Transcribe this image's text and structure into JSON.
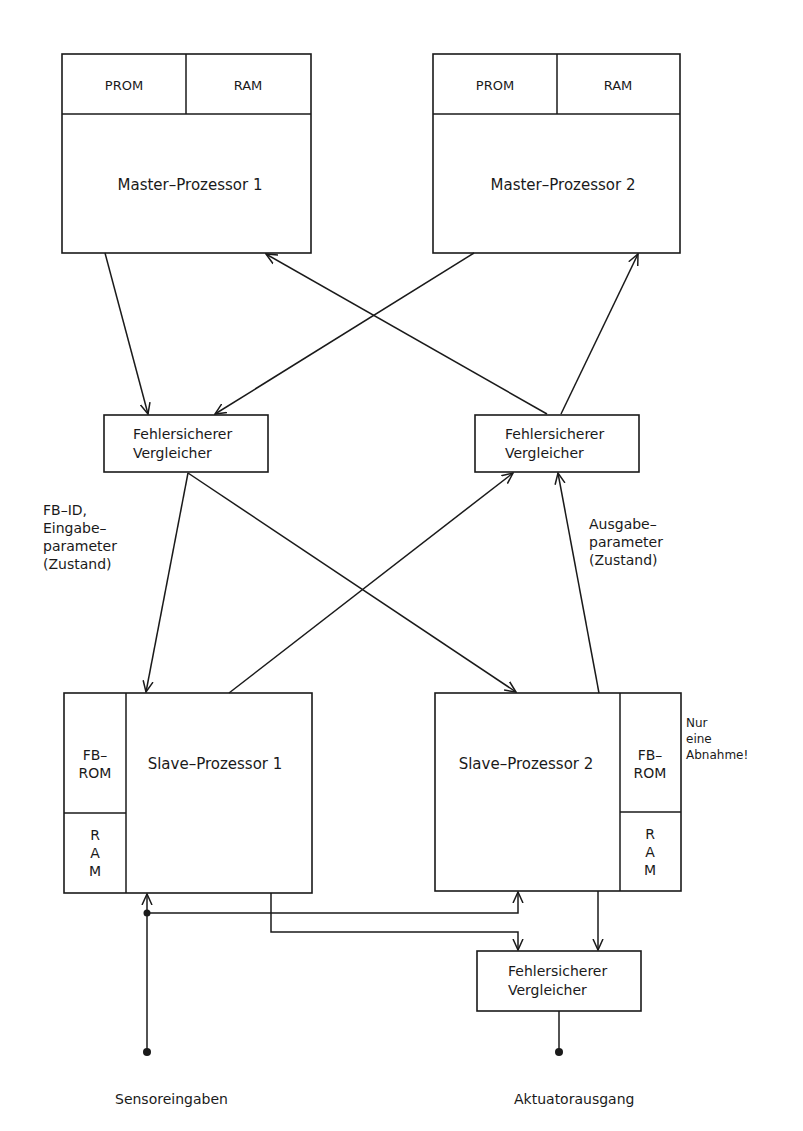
{
  "diagram": {
    "master1": {
      "prom": "PROM",
      "ram": "RAM",
      "label": "Master–Prozessor 1"
    },
    "master2": {
      "prom": "PROM",
      "ram": "RAM",
      "label": "Master–Prozessor 2"
    },
    "comparator_left": {
      "line1": "Fehlersicherer",
      "line2": "Vergleicher"
    },
    "comparator_right": {
      "line1": "Fehlersicherer",
      "line2": "Vergleicher"
    },
    "comparator_bottom": {
      "line1": "Fehlersicherer",
      "line2": "Vergleicher"
    },
    "slave1": {
      "label": "Slave–Prozessor 1",
      "fbrom_line1": "FB–",
      "fbrom_line2": "ROM",
      "ram_r": "R",
      "ram_a": "A",
      "ram_m": "M"
    },
    "slave2": {
      "label": "Slave–Prozessor 2",
      "fbrom_line1": "FB–",
      "fbrom_line2": "ROM",
      "ram_r": "R",
      "ram_a": "A",
      "ram_m": "M"
    },
    "annotation_input": {
      "line1": "FB–ID,",
      "line2": "Eingabe–",
      "line3": "parameter",
      "line4": "(Zustand)"
    },
    "annotation_output": {
      "line1": "Ausgabe–",
      "line2": "parameter",
      "line3": "(Zustand)"
    },
    "annotation_note": {
      "line1": "Nur",
      "line2": "eine",
      "line3": "Abnahme!"
    },
    "sensor_label": "Sensoreingaben",
    "actuator_label": "Aktuatorausgang"
  }
}
